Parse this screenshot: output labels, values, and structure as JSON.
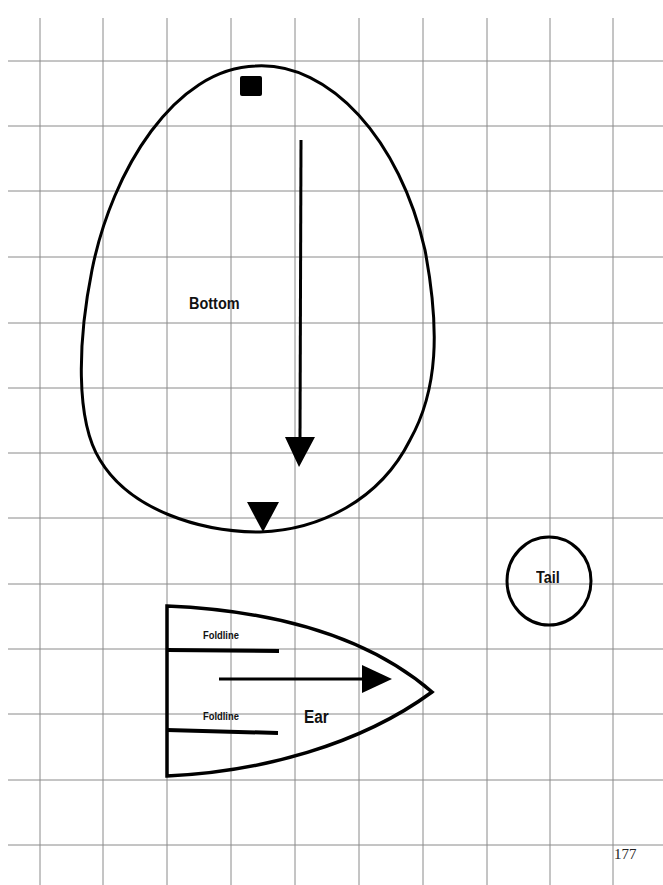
{
  "page": {
    "page_number": "177",
    "background": "#ffffff",
    "grid_color": "#8a8a8a",
    "ink_color": "#000000"
  },
  "pattern_pieces": {
    "bottom": {
      "label": "Bottom"
    },
    "ear": {
      "label": "Ear",
      "foldline_top": "Foldline",
      "foldline_bottom": "Foldline"
    },
    "tail": {
      "label": "Tail"
    }
  },
  "grid": {
    "vertical_x": [
      40,
      103,
      167,
      231,
      295,
      359,
      423,
      487,
      550,
      613
    ],
    "horizontal_y": [
      61,
      126,
      191,
      257,
      323,
      388,
      453,
      518,
      584,
      649,
      714,
      780,
      845
    ]
  }
}
